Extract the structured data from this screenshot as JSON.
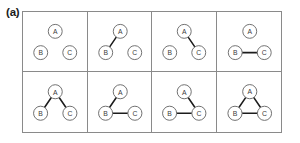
{
  "figure": {
    "panel_label": "(a)",
    "layout": {
      "rows": 2,
      "columns": 4
    },
    "nodes": [
      {
        "id": "A",
        "label": "A",
        "x": 33,
        "y": 20
      },
      {
        "id": "B",
        "label": "B",
        "x": 18,
        "y": 42
      },
      {
        "id": "C",
        "label": "C",
        "x": 48,
        "y": 42
      }
    ],
    "node_radius": 7.2,
    "possible_edges": [
      {
        "id": "AB",
        "from": "A",
        "to": "B"
      },
      {
        "id": "AC",
        "from": "A",
        "to": "C"
      },
      {
        "id": "BC",
        "from": "B",
        "to": "C"
      }
    ],
    "panels": [
      {
        "index": 1,
        "edges": []
      },
      {
        "index": 2,
        "edges": [
          "AB"
        ]
      },
      {
        "index": 3,
        "edges": [
          "AC"
        ]
      },
      {
        "index": 4,
        "edges": [
          "BC"
        ]
      },
      {
        "index": 5,
        "edges": [
          "AB",
          "AC"
        ]
      },
      {
        "index": 6,
        "edges": [
          "AB",
          "BC"
        ]
      },
      {
        "index": 7,
        "edges": [
          "AC",
          "BC"
        ]
      },
      {
        "index": 8,
        "edges": [
          "AB",
          "AC",
          "BC"
        ]
      }
    ],
    "colors": {
      "edge": "#1c1c1c",
      "node_stroke": "#6e6e6e",
      "node_fill": "#ffffff",
      "node_text": "#3a3a3a",
      "grid_border": "#8a8a8a",
      "background": "#ffffff",
      "label_text": "#1a1a1a"
    }
  }
}
